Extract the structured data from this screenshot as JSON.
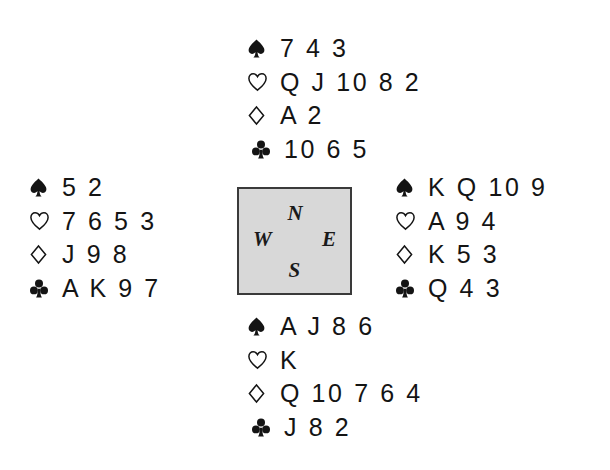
{
  "diagram": {
    "type": "bridge-deal",
    "suit_order": [
      "spades",
      "hearts",
      "diamonds",
      "clubs"
    ],
    "suit_symbols": {
      "spades": "spade-icon",
      "hearts": "heart-icon",
      "diamonds": "diamond-icon",
      "clubs": "club-icon"
    },
    "colors": {
      "ink": "#141414",
      "box_fill": "#d8d8d8",
      "box_border": "#3a3a3a",
      "background": "#ffffff"
    }
  },
  "compass": {
    "north": "N",
    "west": "W",
    "east": "E",
    "south": "S"
  },
  "hands": {
    "north": {
      "seat": "North",
      "spades": "7 4 3",
      "hearts": "Q J 10 8 2",
      "diamonds": "A 2",
      "clubs": "10 6 5"
    },
    "west": {
      "seat": "West",
      "spades": "5 2",
      "hearts": "7 6 5 3",
      "diamonds": "J 9 8",
      "clubs": "A K 9 7"
    },
    "east": {
      "seat": "East",
      "spades": "K Q 10 9",
      "hearts": "A 9 4",
      "diamonds": "K 5 3",
      "clubs": "Q 4 3"
    },
    "south": {
      "seat": "South",
      "spades": "A J 8 6",
      "hearts": "K",
      "diamonds": "Q 10 7 6 4",
      "clubs": "J 8 2"
    }
  }
}
